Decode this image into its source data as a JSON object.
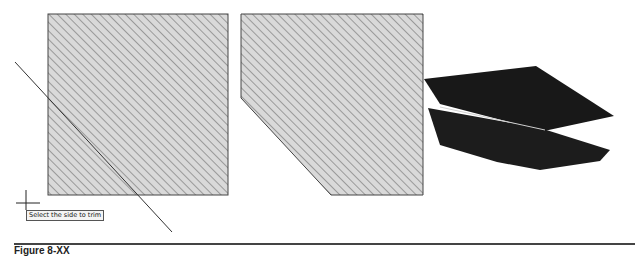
{
  "tooltip": {
    "text": "Select the side to trim"
  },
  "caption": {
    "text": "Figure 8-XX"
  },
  "colors": {
    "hatch_fill": "#d9d9d9",
    "hatch_lines": "#555555",
    "outline": "#444444",
    "solid_3d": "#1a1a1a",
    "edge_highlight": "#cfcfcf"
  },
  "shapes": {
    "before": {
      "label": "rectangle-before-trim",
      "x": 48,
      "y": 14,
      "width": 180,
      "height": 181
    },
    "after": {
      "label": "rectangle-after-trim",
      "points": "241,14 423,14 423,195 331,195 241,98"
    },
    "trim_line": {
      "x1": 15,
      "y1": 62,
      "x2": 172,
      "y2": 232
    },
    "cursor": {
      "x": 26,
      "y": 200
    }
  }
}
